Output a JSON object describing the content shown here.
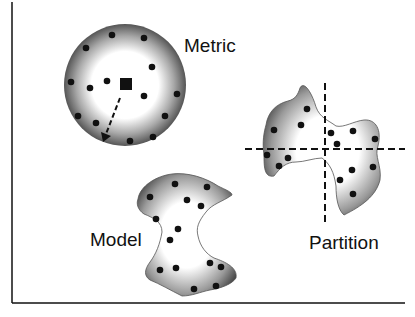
{
  "labels": {
    "metric": "Metric",
    "model": "Model",
    "partition": "Partition"
  },
  "colors": {
    "ink": "#111111",
    "blob_edge": "#4a4a4a",
    "blob_center": "#ffffff",
    "background": "#ffffff"
  },
  "groups": [
    {
      "name": "metric",
      "shape": "circle",
      "point_count": 14,
      "has_center_marker": true,
      "has_radius_arrow": true
    },
    {
      "name": "model",
      "shape": "irregular-blob",
      "point_count": 14
    },
    {
      "name": "partition",
      "shape": "irregular-blob",
      "point_count": 14,
      "divided_by": "dashed-crosshair"
    }
  ]
}
